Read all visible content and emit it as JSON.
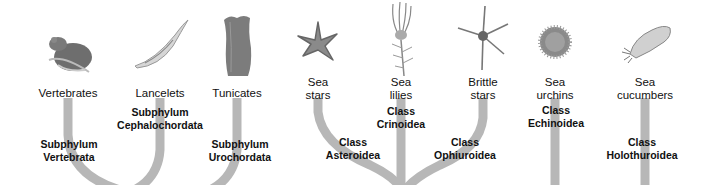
{
  "colors": {
    "branch": "#b7b7b7",
    "text": "#111111",
    "background": "#ffffff"
  },
  "organisms": [
    {
      "name": "Vertebrates",
      "icon": "mouse-icon"
    },
    {
      "name": "Lancelets",
      "icon": "lancelet-icon"
    },
    {
      "name": "Tunicates",
      "icon": "tunicate-icon"
    },
    {
      "name_line1": "Sea",
      "name_line2": "stars",
      "icon": "sea-star-icon"
    },
    {
      "name_line1": "Sea",
      "name_line2": "lilies",
      "icon": "sea-lily-icon"
    },
    {
      "name_line1": "Brittle",
      "name_line2": "stars",
      "icon": "brittle-star-icon"
    },
    {
      "name_line1": "Sea",
      "name_line2": "urchins",
      "icon": "sea-urchin-icon"
    },
    {
      "name_line1": "Sea",
      "name_line2": "cucumbers",
      "icon": "sea-cucumber-icon"
    }
  ],
  "taxa": [
    {
      "rank": "Subphylum",
      "name": "Vertebrata"
    },
    {
      "rank": "Subphylum",
      "name": "Cephalochordata"
    },
    {
      "rank": "Subphylum",
      "name": "Urochordata"
    },
    {
      "rank": "Class",
      "name": "Asteroidea"
    },
    {
      "rank": "Class",
      "name": "Crinoidea"
    },
    {
      "rank": "Class",
      "name": "Ophiuroidea"
    },
    {
      "rank": "Class",
      "name": "Echinoidea"
    },
    {
      "rank": "Class",
      "name": "Holothuroidea"
    }
  ]
}
